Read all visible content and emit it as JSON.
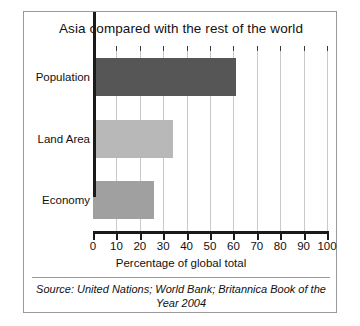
{
  "chart_data": {
    "type": "bar",
    "orientation": "horizontal",
    "title": "Asia compared with the rest of the world",
    "categories": [
      "Population",
      "Land Area",
      "Economy"
    ],
    "values": [
      61,
      34,
      26
    ],
    "bar_colors": [
      "#565656",
      "#b8b8b8",
      "#a0a0a0"
    ],
    "xlabel": "Percentage of global total",
    "ylabel": "",
    "xlim": [
      0,
      100
    ],
    "xticks": [
      0,
      10,
      20,
      30,
      40,
      50,
      60,
      70,
      80,
      90,
      100
    ],
    "xtick_labels": [
      "0",
      "10",
      "20",
      "30",
      "40",
      "50",
      "60",
      "70",
      "80",
      "90",
      "100"
    ],
    "grid": true,
    "grid_axis": "x",
    "legend": false,
    "source_note": "Source: United Nations; World Bank; Britannica Book of the Year 2004"
  }
}
